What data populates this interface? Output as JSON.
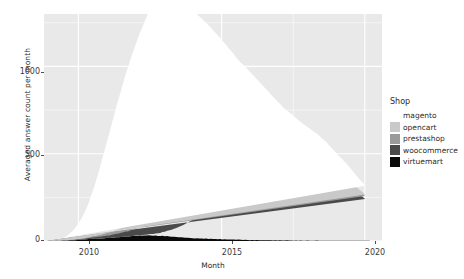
{
  "chart_data": {
    "type": "area",
    "title": "",
    "subtitle": "",
    "xlabel": "Month",
    "ylabel": "Averaged answer count per month",
    "stacked": true,
    "grid": true,
    "legend_position": "right",
    "legend_title": "Shop",
    "xlim": [
      2008.8,
      2020.6
    ],
    "ylim": [
      0,
      1300
    ],
    "xticks": [
      "2010",
      "2015",
      "2020"
    ],
    "xtick_values": [
      2010,
      2015,
      2020
    ],
    "yticks": [
      "0",
      "500",
      "1000"
    ],
    "ytick_values": [
      0,
      500,
      1000
    ],
    "colors": {
      "magento": "#ffffff",
      "opencart": "#c9c9c9",
      "prestashop": "#9a9a9a",
      "woocommerce": "#4a4a4a",
      "virtuemart": "#0a0a0a",
      "panel_background": "#e9e9e9",
      "grid": "#ffffff",
      "text": "#2b2b2b"
    },
    "series": [
      {
        "name": "virtuemart",
        "color": "#0a0a0a",
        "values": [
          1,
          1,
          2,
          2,
          3,
          2,
          3,
          4,
          3,
          4,
          5,
          4,
          5,
          6,
          7,
          8,
          9,
          10,
          11,
          12,
          13,
          12,
          14,
          13,
          15,
          16,
          18,
          17,
          19,
          20,
          22,
          21,
          23,
          24,
          26,
          25,
          27,
          28,
          30,
          29,
          31,
          30,
          32,
          31,
          33,
          32,
          30,
          31,
          29,
          28,
          30,
          27,
          28,
          26,
          25,
          24,
          23,
          22,
          21,
          20,
          19,
          18,
          17,
          16,
          15,
          16,
          14,
          15,
          13,
          14,
          12,
          13,
          11,
          12,
          10,
          11,
          9,
          10,
          9,
          8,
          9,
          8,
          7,
          8,
          7,
          6,
          7,
          6,
          5,
          6,
          5,
          6,
          5,
          4,
          5,
          4,
          5,
          4,
          3,
          4,
          3,
          4,
          3,
          3,
          4,
          3,
          3,
          2,
          3,
          2,
          3,
          2,
          2,
          3,
          2,
          2,
          2,
          3,
          2,
          2,
          2,
          2,
          2,
          1,
          2,
          2,
          1,
          2,
          1,
          2,
          1,
          1,
          2,
          1,
          1,
          1,
          1,
          2,
          1,
          1,
          1
        ]
      },
      {
        "name": "woocommerce",
        "color": "#4a4a4a",
        "values": [
          0,
          0,
          0,
          0,
          0,
          0,
          0,
          0,
          0,
          0,
          0,
          0,
          0,
          0,
          0,
          0,
          0,
          0,
          0,
          0,
          0,
          0,
          0,
          0,
          0,
          0,
          0,
          0,
          0,
          0,
          0,
          0,
          0,
          0,
          0,
          0,
          0,
          1,
          1,
          2,
          2,
          3,
          4,
          5,
          6,
          8,
          10,
          12,
          15,
          18,
          22,
          26,
          30,
          35,
          40,
          46,
          52,
          58,
          65,
          72,
          80,
          88,
          96,
          105,
          114,
          122,
          130,
          140,
          148,
          156,
          165,
          172,
          180,
          188,
          196,
          203,
          210,
          218,
          225,
          232,
          240,
          246,
          252,
          258,
          264,
          270,
          275,
          280,
          284,
          288,
          292,
          296,
          300,
          304,
          308,
          312,
          316,
          320,
          324,
          328,
          332,
          336,
          340,
          344,
          348,
          352,
          356,
          360,
          362,
          364,
          366,
          368,
          370,
          372,
          374,
          376,
          378,
          380,
          378,
          376,
          374,
          370,
          366,
          360,
          354,
          348,
          342,
          336,
          330,
          324,
          318,
          310,
          300,
          290,
          280,
          270,
          260,
          250,
          240
        ]
      },
      {
        "name": "prestashop",
        "color": "#9a9a9a",
        "values": [
          0,
          0,
          0,
          0,
          0,
          0,
          0,
          0,
          1,
          1,
          1,
          2,
          2,
          3,
          3,
          4,
          4,
          5,
          6,
          7,
          8,
          9,
          10,
          11,
          12,
          13,
          14,
          15,
          17,
          18,
          20,
          22,
          24,
          26,
          28,
          30,
          33,
          36,
          38,
          41,
          44,
          46,
          48,
          50,
          52,
          54,
          56,
          58,
          60,
          62,
          63,
          64,
          65,
          66,
          67,
          68,
          69,
          70,
          71,
          72,
          72,
          73,
          73,
          74,
          74,
          74,
          74,
          74,
          73,
          73,
          72,
          72,
          71,
          70,
          70,
          69,
          68,
          67,
          66,
          65,
          64,
          63,
          62,
          61,
          60,
          59,
          58,
          57,
          56,
          55,
          54,
          53,
          52,
          51,
          50,
          49,
          48,
          47,
          46,
          45,
          44,
          43,
          42,
          41,
          40,
          40,
          39,
          38,
          37,
          36,
          36,
          35,
          34,
          33,
          33,
          32,
          31,
          30,
          30,
          29,
          28,
          28,
          27,
          26,
          26,
          25,
          24,
          24,
          23,
          22,
          22,
          21,
          20,
          20,
          19,
          18,
          18,
          17,
          16
        ]
      },
      {
        "name": "opencart",
        "color": "#c9c9c9",
        "values": [
          0,
          0,
          0,
          0,
          0,
          0,
          0,
          0,
          0,
          0,
          1,
          1,
          1,
          2,
          2,
          3,
          3,
          4,
          5,
          6,
          7,
          8,
          9,
          10,
          12,
          13,
          15,
          16,
          18,
          20,
          22,
          24,
          27,
          29,
          32,
          35,
          38,
          41,
          44,
          47,
          50,
          53,
          56,
          59,
          62,
          65,
          68,
          70,
          73,
          75,
          78,
          80,
          82,
          84,
          86,
          88,
          90,
          91,
          92,
          93,
          94,
          95,
          96,
          96,
          97,
          97,
          97,
          97,
          97,
          96,
          96,
          95,
          94,
          93,
          92,
          91,
          90,
          88,
          87,
          85,
          84,
          82,
          80,
          78,
          76,
          74,
          72,
          70,
          68,
          66,
          64,
          62,
          60,
          58,
          56,
          54,
          52,
          50,
          48,
          46,
          44,
          43,
          41,
          40,
          38,
          37,
          35,
          34,
          33,
          31,
          30,
          29,
          28,
          27,
          26,
          25,
          24,
          23,
          22,
          21,
          20,
          20,
          19,
          18,
          17,
          17,
          16,
          15,
          15,
          14,
          13,
          13,
          12,
          12,
          11,
          11,
          10,
          10,
          9
        ]
      },
      {
        "name": "magento",
        "color": "#ffffff",
        "values": [
          2,
          3,
          4,
          5,
          7,
          9,
          12,
          16,
          22,
          30,
          40,
          52,
          66,
          82,
          100,
          120,
          145,
          170,
          200,
          235,
          270,
          310,
          350,
          395,
          440,
          485,
          530,
          575,
          620,
          665,
          710,
          750,
          790,
          830,
          870,
          905,
          940,
          970,
          1000,
          1030,
          1060,
          1085,
          1110,
          1135,
          1160,
          1185,
          1205,
          1225,
          1240,
          1250,
          1245,
          1235,
          1225,
          1210,
          1195,
          1180,
          1165,
          1150,
          1130,
          1110,
          1090,
          1070,
          1050,
          1030,
          1010,
          990,
          970,
          950,
          930,
          910,
          890,
          870,
          850,
          830,
          810,
          790,
          770,
          750,
          730,
          710,
          690,
          670,
          650,
          630,
          615,
          600,
          585,
          570,
          555,
          540,
          525,
          510,
          495,
          480,
          465,
          450,
          435,
          420,
          405,
          390,
          375,
          360,
          345,
          330,
          318,
          306,
          294,
          282,
          270,
          258,
          248,
          238,
          228,
          218,
          208,
          198,
          188,
          180,
          172,
          164,
          156,
          148,
          140,
          133,
          126,
          119,
          112,
          106,
          100,
          94,
          88,
          82,
          77,
          72,
          67,
          62,
          58,
          54,
          50,
          46
        ]
      }
    ]
  },
  "axes": {
    "y_title": "Averaged answer count per month",
    "x_title": "Month",
    "y_tick_labels": [
      "1000",
      "500",
      "0"
    ],
    "x_tick_labels": [
      "2010",
      "2015",
      "2020"
    ]
  },
  "legend": {
    "title": "Shop",
    "items": [
      {
        "label": "magento",
        "color": "#ffffff"
      },
      {
        "label": "opencart",
        "color": "#c9c9c9"
      },
      {
        "label": "prestashop",
        "color": "#9a9a9a"
      },
      {
        "label": "woocommerce",
        "color": "#4a4a4a"
      },
      {
        "label": "virtuemart",
        "color": "#0a0a0a"
      }
    ]
  }
}
